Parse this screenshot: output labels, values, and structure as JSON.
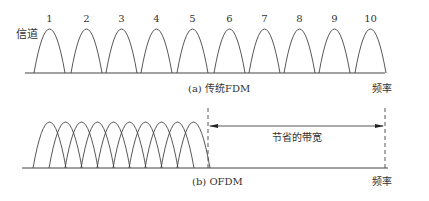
{
  "panel_a": {
    "axis_label_y": "信道",
    "caption": "(a) 传统FDM",
    "axis_label_x": "频率",
    "channels": [
      "1",
      "2",
      "3",
      "4",
      "5",
      "6",
      "7",
      "8",
      "9",
      "10"
    ]
  },
  "panel_b": {
    "caption": "(b) OFDM",
    "axis_label_x": "频率",
    "saved_bandwidth_label": "节省的带宽",
    "subcarrier_count": 10
  },
  "colors": {
    "stroke": "#444444",
    "text": "#333333"
  }
}
